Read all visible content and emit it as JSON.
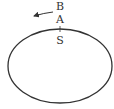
{
  "diagram": {
    "labels": {
      "b": "B",
      "a": "A",
      "s": "S"
    },
    "ellipse": {
      "cx": 60,
      "cy": 66,
      "rx": 52,
      "ry": 37,
      "stroke": "#333333"
    },
    "arrow": {
      "direction": "left",
      "color": "#333333"
    }
  }
}
